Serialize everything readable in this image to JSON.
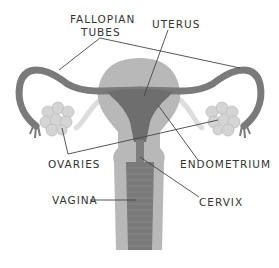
{
  "labels": {
    "fallopian_line1": "FALLOPIAN",
    "fallopian_line2": "TUBES",
    "uterus": "UTERUS",
    "ovaries": "OVARIES",
    "endometrium": "ENDOMETRIUM",
    "vagina": "VAGINA",
    "cervix": "CERVIX"
  },
  "colors": {
    "tissue_light": "#b8b8b8",
    "tissue_dark": "#6e6e6e",
    "tube": "#7a7a7a",
    "ovary": "#d4d4d4",
    "leader_line": "#444444",
    "text": "#333333"
  }
}
